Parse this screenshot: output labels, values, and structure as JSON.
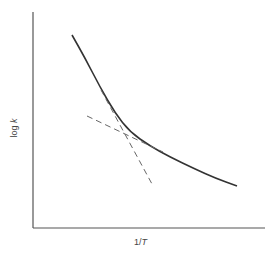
{
  "chart_data": {
    "type": "line",
    "title": "",
    "xlabel": "1/T",
    "ylabel": "log k",
    "grid": false,
    "legend": null,
    "axis_ticks": "none",
    "series": [
      {
        "name": "curve",
        "style": "solid",
        "description": "concave-up decreasing curve of log k vs 1/T",
        "points_px": [
          [
            72,
            35
          ],
          [
            85,
            58
          ],
          [
            100,
            87
          ],
          [
            115,
            113
          ],
          [
            130,
            132
          ],
          [
            150,
            146
          ],
          [
            170,
            157
          ],
          [
            195,
            169
          ],
          [
            215,
            178
          ],
          [
            237,
            186
          ]
        ]
      },
      {
        "name": "steep-tangent",
        "style": "dashed",
        "description": "tangent to high-temperature (left) region",
        "points_px": [
          [
            101,
            90
          ],
          [
            152,
            184
          ]
        ]
      },
      {
        "name": "shallow-tangent",
        "style": "dashed",
        "description": "tangent to low-temperature (right) region",
        "points_px": [
          [
            87,
            116
          ],
          [
            163,
            152
          ]
        ]
      }
    ],
    "axes": {
      "x_axis_px": [
        [
          33,
          228
        ],
        [
          265,
          228
        ]
      ],
      "y_axis_px": [
        [
          33,
          12
        ],
        [
          33,
          228
        ]
      ]
    }
  },
  "labels": {
    "y_prefix": "log ",
    "y_var": "k",
    "x_prefix": "1/",
    "x_var": "T"
  },
  "colors": {
    "axis": "#555555",
    "curve": "#333333",
    "dashed": "#666666"
  }
}
